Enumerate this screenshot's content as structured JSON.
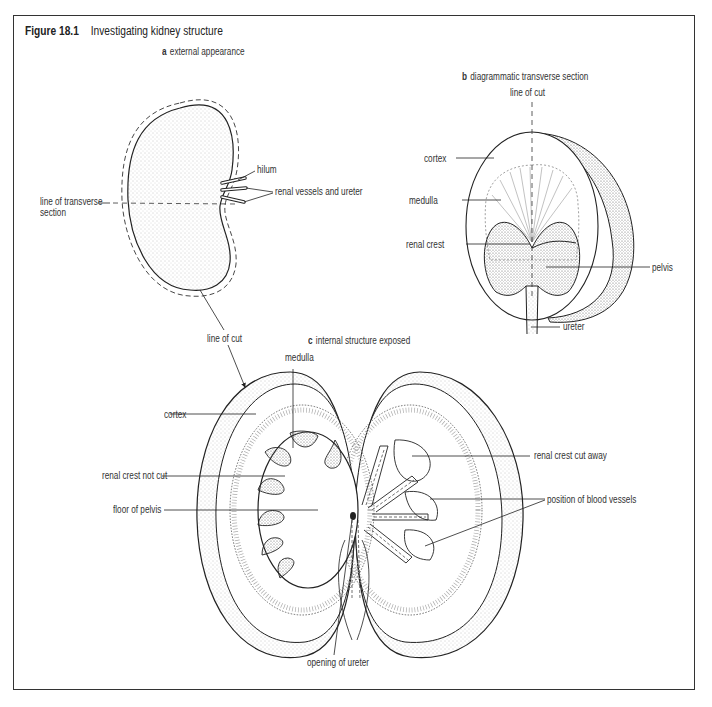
{
  "figure": {
    "number": "Figure 18.1",
    "title": "Investigating kidney structure"
  },
  "panels": {
    "a": {
      "letter": "a",
      "caption": "external appearance",
      "labels": {
        "hilum": "hilum",
        "renal_vessels": "renal vessels and ureter",
        "transverse_line_1": "line of transverse",
        "transverse_line_2": "section",
        "line_of_cut": "line of cut"
      }
    },
    "b": {
      "letter": "b",
      "caption": "diagrammatic transverse section",
      "labels": {
        "line_of_cut": "line of cut",
        "cortex": "cortex",
        "medulla": "medulla",
        "renal_crest": "renal crest",
        "pelvis": "pelvis",
        "ureter": "ureter"
      }
    },
    "c": {
      "letter": "c",
      "caption": "internal structure exposed",
      "labels": {
        "medulla": "medulla",
        "cortex": "cortex",
        "renal_crest_not_cut": "renal crest not cut",
        "floor_of_pelvis": "floor of pelvis",
        "renal_crest_cut_away": "renal crest cut away",
        "blood_vessels": "position of blood vessels",
        "opening_of_ureter": "opening of ureter"
      }
    }
  },
  "colors": {
    "line": "#222222",
    "stipple": "#9a9a9a",
    "frame": "#333333"
  }
}
